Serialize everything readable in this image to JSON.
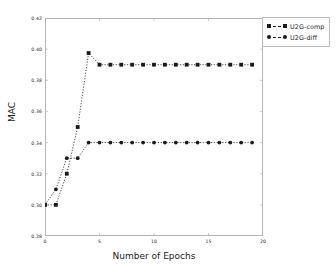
{
  "chart_data": {
    "type": "line",
    "title": "",
    "xlabel": "Number of Epochs",
    "ylabel": "MAC",
    "xlim": [
      0,
      20
    ],
    "ylim": [
      0.28,
      0.42
    ],
    "xticks": [
      0,
      5,
      10,
      15,
      20
    ],
    "xtick_labels": [
      "0",
      "5",
      "10",
      "15",
      "20"
    ],
    "yticks": [
      0.28,
      0.3,
      0.32,
      0.34,
      0.36,
      0.38,
      0.4,
      0.42
    ],
    "ytick_labels": [
      "0.28",
      "0.30",
      "0.32",
      "0.34",
      "0.36",
      "0.38",
      "0.40",
      "0.42"
    ],
    "grid": false,
    "legend_position": "upper right outside",
    "x": [
      0,
      1,
      2,
      3,
      4,
      5,
      6,
      7,
      8,
      9,
      10,
      11,
      12,
      13,
      14,
      15,
      16,
      17,
      18,
      19
    ],
    "series": [
      {
        "name": "U2G-comp",
        "marker": "square",
        "linestyle": "dashed",
        "color": "#1a1a1a",
        "values": [
          0.3,
          0.3,
          0.32,
          0.35,
          0.3975,
          0.39,
          0.39,
          0.39,
          0.39,
          0.39,
          0.39,
          0.39,
          0.39,
          0.39,
          0.39,
          0.39,
          0.39,
          0.39,
          0.39,
          0.39
        ]
      },
      {
        "name": "U2G-diff",
        "marker": "circle",
        "linestyle": "dashed",
        "color": "#1a1a1a",
        "values": [
          0.3,
          0.31,
          0.33,
          0.33,
          0.34,
          0.34,
          0.34,
          0.34,
          0.34,
          0.34,
          0.34,
          0.34,
          0.34,
          0.34,
          0.34,
          0.34,
          0.34,
          0.34,
          0.34,
          0.34
        ]
      }
    ]
  },
  "legend": {
    "entries": [
      {
        "label": "U2G-comp"
      },
      {
        "label": "U2G-diff"
      }
    ]
  }
}
